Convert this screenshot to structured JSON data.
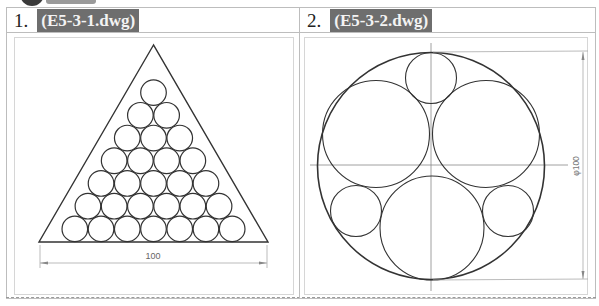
{
  "exercises": [
    {
      "number": "1.",
      "filename": "(E5-3-1.dwg)",
      "drawing": {
        "type": "triangle-circle-packing",
        "rows": 7,
        "circles_total": 28,
        "dimension_label": "100"
      }
    },
    {
      "number": "2.",
      "filename": "(E5-3-2.dwg)",
      "drawing": {
        "type": "circle-in-circle",
        "inner_circles": 6,
        "dimension_label": "φ100"
      }
    }
  ],
  "colors": {
    "filename_bg": "#6e6e6e",
    "filename_text": "#f3f3f3",
    "line": "#333333",
    "dim_line": "#9a9a9a",
    "border": "#bdbdbd"
  }
}
